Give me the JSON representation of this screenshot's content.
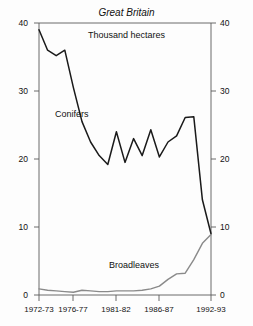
{
  "chart_data": {
    "type": "line",
    "title": "Great Britain",
    "subtitle": "Thousand hectares",
    "xlabel": "",
    "ylabel": "Thousand hectares",
    "ylim": [
      0,
      40
    ],
    "yticks": [
      0,
      10,
      20,
      30,
      40
    ],
    "grid": false,
    "legend": "inline-annotations",
    "dual_axis": true,
    "x": [
      "1972-73",
      "1973-74",
      "1974-75",
      "1975-76",
      "1976-77",
      "1977-78",
      "1978-79",
      "1979-80",
      "1980-81",
      "1981-82",
      "1982-83",
      "1983-84",
      "1984-85",
      "1985-86",
      "1986-87",
      "1987-88",
      "1988-89",
      "1989-90",
      "1990-91",
      "1991-92",
      "1992-93"
    ],
    "series": [
      {
        "name": "Conifers",
        "values": [
          39.0,
          36.0,
          35.2,
          36.0,
          30.5,
          25.5,
          22.5,
          20.5,
          19.2,
          24.0,
          19.5,
          23.0,
          20.5,
          24.3,
          20.3,
          22.5,
          23.4,
          26.1,
          26.2,
          14.0,
          9.0
        ]
      },
      {
        "name": "Broadleaves",
        "values": [
          0.9,
          0.7,
          0.6,
          0.5,
          0.4,
          0.7,
          0.6,
          0.5,
          0.5,
          0.6,
          0.6,
          0.6,
          0.7,
          0.9,
          1.3,
          2.3,
          3.1,
          3.2,
          5.2,
          7.6,
          8.9
        ]
      }
    ],
    "xtick_labels": [
      "1972-73",
      "1976-77",
      "1981-82",
      "1986-87",
      "1992-93"
    ],
    "ytick_labels_left": [
      "40",
      "30",
      "20",
      "10",
      "0"
    ],
    "ytick_labels_right": [
      "40",
      "30",
      "20",
      "10",
      "0"
    ],
    "colors": {
      "conifers": "#1a1a1a",
      "broadleaves": "#8a8a8a",
      "axis": "#555555",
      "background": "#fdfdfd"
    }
  },
  "annotations": {
    "conifers_label": "Conifers",
    "broadleaves_label": "Broadleaves"
  }
}
